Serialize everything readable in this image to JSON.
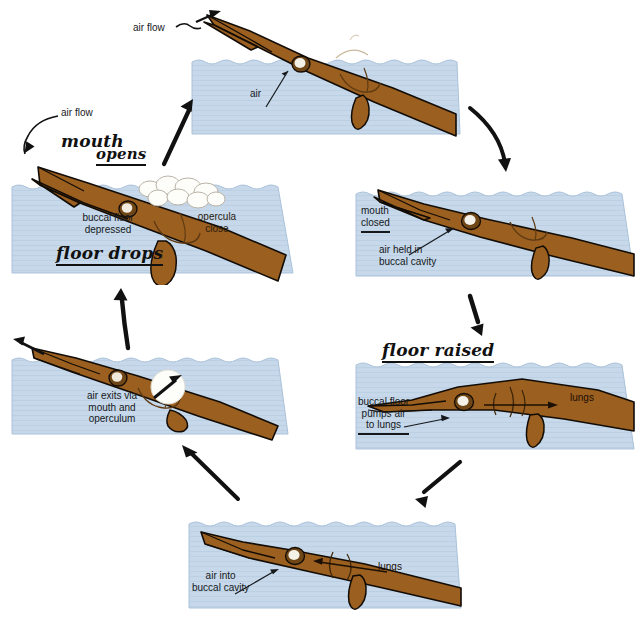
{
  "diagram": {
    "colors": {
      "water": "#c6d8e9",
      "water_edge": "#aac2da",
      "fish_body": "#9b5f1f",
      "fish_outline": "#120c06",
      "bubble": "#fdfdfb",
      "ink": "#16181c",
      "hand_ink": "#111111"
    }
  },
  "panels": {
    "p1": {
      "name": "surface-air-intake",
      "labels": {
        "air": "air"
      },
      "external": {
        "air_flow": "air flow"
      }
    },
    "p2": {
      "name": "mouth-closed-air-held",
      "labels": {
        "mouth_closed": "mouth\nclosed",
        "air_held": "air held in\nbuccal cavity"
      }
    },
    "p3": {
      "name": "buccal-floor-pumps-air-to-lungs",
      "labels": {
        "pumps": "buccal floor\npumps air\nto lungs",
        "lungs": "lungs"
      },
      "hand": {
        "floor_raised": "floor raised"
      }
    },
    "p4": {
      "name": "air-into-buccal-cavity",
      "labels": {
        "air_into": "air into\nbuccal cavity",
        "lungs": "lungs"
      }
    },
    "p5": {
      "name": "air-exits-mouth-and-operculum",
      "labels": {
        "air_exits": "air exits via\nmouth and\noperculum"
      }
    },
    "p6": {
      "name": "mouth-opens-floor-drops",
      "labels": {
        "buccal_floor": "buccal floor\ndepressed",
        "opercula": "opercula\nclose"
      },
      "hand": {
        "mouth": "mouth",
        "opens": "opens",
        "floor_drops": "floor drops"
      },
      "external": {
        "air_flow": "air flow"
      }
    }
  },
  "icons": {
    "cycle_arrow": "cycle-arrow-icon",
    "air_flow_arrow": "air-flow-arrow-icon",
    "leader_arrow": "leader-arrow-icon"
  }
}
